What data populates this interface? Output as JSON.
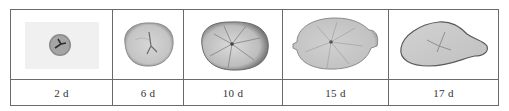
{
  "figure": {
    "panels": [
      {
        "label": "2 d",
        "image": "otolith-2d",
        "description": "small round otolith with dark core on pale grey background"
      },
      {
        "label": "6 d",
        "image": "otolith-6d",
        "description": "rounded oval otolith, light grey"
      },
      {
        "label": "10 d",
        "image": "otolith-10d",
        "description": "larger rounded-square otolith with radial lines, darker edge on right"
      },
      {
        "label": "15 d",
        "image": "otolith-15d",
        "description": "wide oval otolith with lobe on right side"
      },
      {
        "label": "17 d",
        "image": "otolith-17d",
        "description": "elongated teardrop otolith tapering to the right"
      }
    ]
  },
  "colors": {
    "border": "#6a6a6a",
    "text": "#333333",
    "otolith_fill": "#c9c9c9",
    "otolith_edge": "#7a7a7a"
  }
}
